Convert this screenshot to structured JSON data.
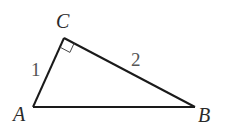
{
  "diagram": {
    "type": "right-triangle",
    "vertices": [
      {
        "label": "A",
        "x": 33,
        "y": 107
      },
      {
        "label": "B",
        "x": 195,
        "y": 107
      },
      {
        "label": "C",
        "x": 64,
        "y": 38
      }
    ],
    "sides": [
      {
        "name": "AC",
        "length_label": "1"
      },
      {
        "name": "CB",
        "length_label": "2"
      },
      {
        "name": "AB",
        "length_label": ""
      }
    ],
    "right_angle_at": "C",
    "colors": {
      "stroke": "#1a1a1a",
      "label": "#2a2a2a",
      "length_label": "#555555",
      "background": "#ffffff"
    }
  }
}
